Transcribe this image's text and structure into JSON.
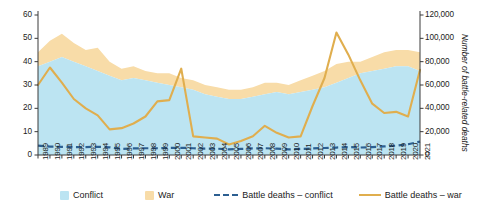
{
  "chart_data": {
    "type": "area",
    "title": "",
    "xlabel": "",
    "ylabel": "",
    "ylabel_right": "Number of battle-related deaths",
    "grid": false,
    "legend_position": "bottom",
    "ylim": [
      0,
      60
    ],
    "ylim_right": [
      0,
      120000
    ],
    "yticks": [
      "0",
      "10",
      "20",
      "30",
      "40",
      "50",
      "60"
    ],
    "yticks_right": [
      "0",
      "20,000",
      "40,000",
      "60,000",
      "80,000",
      "100,000",
      "120,000"
    ],
    "categories": [
      "1989",
      "1990",
      "1991",
      "1992",
      "1993",
      "1994",
      "1995",
      "1996",
      "1997",
      "1998",
      "1999",
      "2000",
      "2001",
      "2002",
      "2003",
      "2004",
      "2005",
      "2006",
      "2007",
      "2008",
      "2009",
      "2010",
      "2011",
      "2012",
      "2013",
      "2014",
      "2015",
      "2016",
      "2017",
      "2018",
      "2019",
      "2020",
      "2021"
    ],
    "series": [
      {
        "name": "Conflict",
        "type": "area-stacked",
        "axis": "left",
        "color": "#bce4f2",
        "values": [
          38,
          40,
          42,
          40,
          38,
          36,
          34,
          32,
          33,
          32,
          31,
          30,
          29,
          28,
          26,
          25,
          24,
          24,
          25,
          26,
          27,
          26,
          27,
          28,
          29,
          31,
          33,
          35,
          36,
          37,
          38,
          38,
          36
        ]
      },
      {
        "name": "War",
        "type": "area-stacked",
        "axis": "left",
        "color": "#f8dca8",
        "values": [
          6,
          9,
          10,
          8,
          7,
          10,
          6,
          5,
          5,
          4,
          4,
          5,
          4,
          4,
          4,
          4,
          4,
          4,
          4,
          5,
          4,
          4,
          5,
          6,
          7,
          8,
          7,
          5,
          6,
          7,
          7,
          7,
          8
        ]
      },
      {
        "name": "Battle deaths – conflict",
        "type": "line-dashed",
        "axis": "right",
        "color": "#2c5f91",
        "values": [
          8000,
          7200,
          7000,
          6800,
          6800,
          7000,
          6600,
          5200,
          5600,
          5800,
          5800,
          6000,
          6200,
          5800,
          5400,
          5400,
          4800,
          5200,
          5600,
          5800,
          5400,
          4800,
          5200,
          5600,
          6000,
          6400,
          6800,
          6400,
          6800,
          7400,
          8000,
          9200,
          11500
        ]
      },
      {
        "name": "Battle deaths – war",
        "type": "line",
        "axis": "right",
        "color": "#e0ae4e",
        "values": [
          60000,
          75000,
          62000,
          48000,
          40000,
          34000,
          22000,
          23000,
          27000,
          33000,
          46000,
          47000,
          74000,
          16000,
          15000,
          14000,
          9000,
          12000,
          16000,
          25000,
          19000,
          15000,
          16000,
          42000,
          66000,
          105000,
          86000,
          64000,
          44000,
          36000,
          37000,
          33000,
          73000
        ]
      }
    ]
  },
  "legend": {
    "items": [
      {
        "label": "Conflict",
        "marker": "swatch",
        "color": "#bce4f2"
      },
      {
        "label": "War",
        "marker": "swatch",
        "color": "#f8dca8"
      },
      {
        "label": "Battle deaths – conflict",
        "marker": "dashed-line",
        "color": "#2c5f91"
      },
      {
        "label": "Battle deaths – war",
        "marker": "solid-line",
        "color": "#e0ae4e"
      }
    ]
  }
}
